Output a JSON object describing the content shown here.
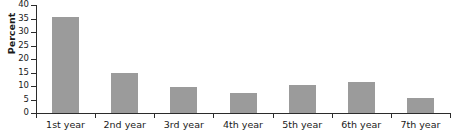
{
  "chart_data": {
    "type": "bar",
    "title": "",
    "xlabel": "",
    "ylabel": "Percent",
    "categories": [
      "1st year",
      "2nd year",
      "3rd year",
      "4th year",
      "5th year",
      "6th year",
      "7th year"
    ],
    "values": [
      35.5,
      15.0,
      9.8,
      7.4,
      10.5,
      11.5,
      5.6
    ],
    "ylim": [
      0,
      40
    ],
    "ytick_labels": [
      "0",
      "5",
      "10",
      "15",
      "20",
      "25",
      "30",
      "35",
      "40"
    ],
    "ytick_values": [
      0,
      5,
      10,
      15,
      20,
      25,
      30,
      35,
      40
    ],
    "grid": false,
    "legend": false,
    "bar_color": "#9b9b9b",
    "axis_color": "#2b2b2b",
    "text_color": "#1a1a1a",
    "background_color": "#ffffff"
  }
}
